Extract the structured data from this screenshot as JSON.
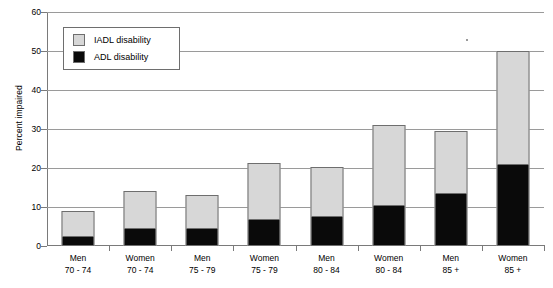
{
  "chart_data": {
    "type": "bar",
    "subtype": "stacked-bar",
    "title": "",
    "xlabel": "",
    "ylabel": "Percent impaired",
    "ylim": [
      0,
      60
    ],
    "ytick_step": 10,
    "yticks": [
      0,
      10,
      20,
      30,
      40,
      50,
      60
    ],
    "grid": true,
    "legend_position": "top-left-inside",
    "categories": [
      "Men 70 - 74",
      "Women 70 - 74",
      "Men 75 - 79",
      "Women 75 - 79",
      "Men 80 - 84",
      "Women 80 - 84",
      "Men 85 +",
      "Women 85 +"
    ],
    "category_lines": [
      {
        "line1": "Men",
        "line2": "70 - 74"
      },
      {
        "line1": "Women",
        "line2": "70 - 74"
      },
      {
        "line1": "Men",
        "line2": "75 - 79"
      },
      {
        "line1": "Women",
        "line2": "75 - 79"
      },
      {
        "line1": "Men",
        "line2": "80 - 84"
      },
      {
        "line1": "Women",
        "line2": "80 - 84"
      },
      {
        "line1": "Men",
        "line2": "85 +"
      },
      {
        "line1": "Women",
        "line2": "85 +"
      }
    ],
    "series": [
      {
        "name": "ADL disability",
        "color": "#0a0a0a",
        "stack_order": "bottom",
        "values": [
          2,
          4,
          4,
          6.5,
          7.3,
          10,
          13,
          20.5
        ]
      },
      {
        "name": "IADL disability",
        "color": "#d7d7d7",
        "stack_order": "top",
        "values": [
          7,
          10,
          9,
          14.8,
          13,
          21,
          16.5,
          29.5
        ]
      }
    ],
    "totals": [
      9,
      14,
      13,
      21.3,
      20.3,
      31,
      29.5,
      50
    ]
  },
  "legend": {
    "items": [
      {
        "label": "IADL disability",
        "swatch": "light-gray"
      },
      {
        "label": "ADL disability",
        "swatch": "black"
      }
    ]
  },
  "axis": {
    "y_title": "Percent impaired",
    "y_tick_labels": [
      "60",
      "50",
      "40",
      "30",
      "20",
      "10",
      "0"
    ]
  },
  "colors": {
    "iadl": "#d7d7d7",
    "adl": "#0a0a0a",
    "grid": "#9a9a9a",
    "axis": "#7a7a7a",
    "bar_outline": "#6e6e6e",
    "background": "#ffffff"
  }
}
